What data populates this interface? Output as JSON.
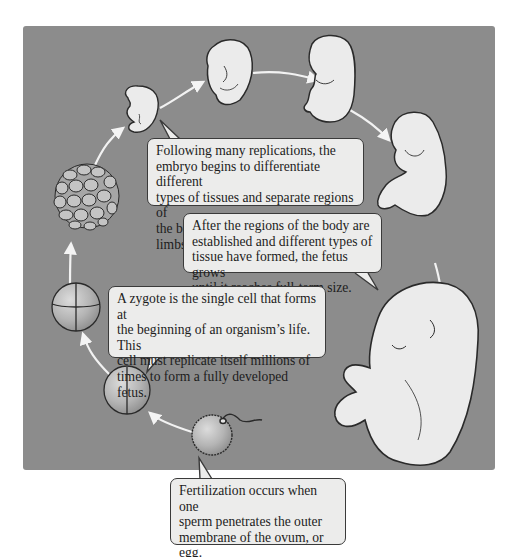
{
  "diagram": {
    "title": "",
    "colors": {
      "background": "#ffffff",
      "panel": "#8c8c8c",
      "callout_fill": "#ececeb",
      "outline": "#2a2a2a",
      "arrow": "#f4f4f4",
      "cell_fill": "#b8b8b8",
      "embryo_fill": "#e6e6e6"
    },
    "stages": [
      {
        "id": "fertilized-ovum",
        "label": "ovum with sperm"
      },
      {
        "id": "two-cell",
        "label": "two-cell stage"
      },
      {
        "id": "four-cell",
        "label": "four-cell stage"
      },
      {
        "id": "morula",
        "label": "cell cluster"
      },
      {
        "id": "early-embryo",
        "label": "early embryo"
      },
      {
        "id": "embryo-curled",
        "label": "embryo"
      },
      {
        "id": "embryo-limbs",
        "label": "embryo with limbs"
      },
      {
        "id": "fetus",
        "label": "fetus"
      },
      {
        "id": "full-term-fetus",
        "label": "full-term fetus"
      }
    ],
    "callouts": {
      "differentiation": "Following many replications, the\nembryo begins to differentiate different\ntypes of tissues and separate regions of\nthe body, such as the head and limbs.",
      "fetal_growth": "After the regions of the body are\nestablished and different types of\ntissue have formed, the fetus grows\nuntil it reaches full-term size.",
      "zygote": "A zygote is the single cell that forms at\nthe beginning of an organism’s life. This\ncell must replicate itself millions of\ntimes to form a fully developed fetus.",
      "fertilization": "Fertilization occurs when one\nsperm penetrates the outer\nmembrane of the ovum, or egg."
    }
  }
}
